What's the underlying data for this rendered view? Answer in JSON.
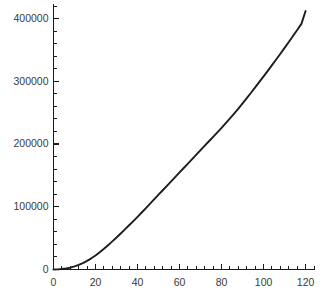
{
  "chart_data": {
    "type": "line",
    "title": "",
    "subtitle": "",
    "xlabel": "",
    "ylabel": "",
    "xlim": [
      0,
      124
    ],
    "ylim": [
      0,
      424000
    ],
    "grid": false,
    "legend": false,
    "legend_position": "none",
    "line_color": "#1c1c1c",
    "axis_color": "#1a1a1a",
    "background_color": "#ffffff",
    "x_ticks": [
      0,
      20,
      40,
      60,
      80,
      100,
      120
    ],
    "x_tick_labels": [
      "0",
      "20",
      "40",
      "60",
      "80",
      "100",
      "120"
    ],
    "x_minor_step": 4,
    "y_ticks": [
      0,
      100000,
      200000,
      300000,
      400000
    ],
    "y_tick_labels": [
      "0",
      "100000",
      "200000",
      "300000",
      "400000"
    ],
    "y_minor_step": 20000,
    "series": [
      {
        "name": "series-1",
        "x": [
          0,
          2,
          4,
          6,
          8,
          10,
          12,
          14,
          16,
          18,
          20,
          22,
          24,
          26,
          28,
          30,
          32,
          34,
          36,
          38,
          40,
          42,
          44,
          46,
          48,
          50,
          52,
          54,
          56,
          58,
          60,
          62,
          64,
          66,
          68,
          70,
          72,
          74,
          76,
          78,
          80,
          82,
          84,
          86,
          88,
          90,
          92,
          94,
          96,
          98,
          100,
          102,
          104,
          106,
          108,
          110,
          112,
          114,
          116,
          118,
          120
        ],
        "values": [
          0,
          200,
          700,
          1600,
          3000,
          4900,
          7300,
          10300,
          13800,
          17800,
          22400,
          27500,
          33000,
          38800,
          44800,
          51000,
          57400,
          63900,
          70500,
          77200,
          84000,
          90900,
          97900,
          105000,
          112100,
          119200,
          126300,
          133400,
          140500,
          147600,
          154700,
          161800,
          168900,
          176000,
          183100,
          190200,
          197300,
          204400,
          211500,
          218600,
          225800,
          233200,
          240800,
          248600,
          256600,
          264800,
          273200,
          281700,
          290300,
          299000,
          307800,
          316700,
          325700,
          334800,
          344000,
          353300,
          362700,
          372200,
          381800,
          391500,
          412000
        ]
      }
    ],
    "annotations": []
  }
}
